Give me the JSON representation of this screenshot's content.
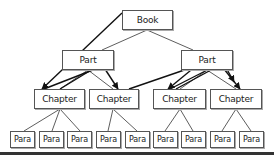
{
  "diagram": {
    "nodes": [
      {
        "id": "book",
        "label": "Book",
        "x": 122,
        "y": 10,
        "w": 51,
        "h": 20,
        "cls": ""
      },
      {
        "id": "part1",
        "label": "Part",
        "x": 62,
        "y": 50,
        "w": 52,
        "h": 20,
        "cls": ""
      },
      {
        "id": "part2",
        "label": "Part",
        "x": 181,
        "y": 50,
        "w": 52,
        "h": 20,
        "cls": ""
      },
      {
        "id": "ch1",
        "label": "Chapter",
        "x": 34,
        "y": 89,
        "w": 51,
        "h": 20,
        "cls": ""
      },
      {
        "id": "ch2",
        "label": "Chapter",
        "x": 89,
        "y": 89,
        "w": 50,
        "h": 20,
        "cls": ""
      },
      {
        "id": "ch3",
        "label": "Chapter",
        "x": 153,
        "y": 89,
        "w": 53,
        "h": 20,
        "cls": ""
      },
      {
        "id": "ch4",
        "label": "Chapter",
        "x": 210,
        "y": 89,
        "w": 52,
        "h": 20,
        "cls": ""
      },
      {
        "id": "p1",
        "label": "Para",
        "x": 10,
        "y": 131,
        "w": 25,
        "h": 17,
        "cls": "para"
      },
      {
        "id": "p2",
        "label": "Para",
        "x": 39,
        "y": 131,
        "w": 25,
        "h": 17,
        "cls": "para"
      },
      {
        "id": "p3",
        "label": "Para",
        "x": 67,
        "y": 131,
        "w": 25,
        "h": 17,
        "cls": "para"
      },
      {
        "id": "p4",
        "label": "Para",
        "x": 96,
        "y": 131,
        "w": 25,
        "h": 17,
        "cls": "para"
      },
      {
        "id": "p5",
        "label": "Para",
        "x": 125,
        "y": 131,
        "w": 25,
        "h": 17,
        "cls": "para"
      },
      {
        "id": "p6",
        "label": "Para",
        "x": 153,
        "y": 131,
        "w": 25,
        "h": 17,
        "cls": "para"
      },
      {
        "id": "p7",
        "label": "Para",
        "x": 181,
        "y": 131,
        "w": 25,
        "h": 17,
        "cls": "para"
      },
      {
        "id": "p8",
        "label": "Para",
        "x": 210,
        "y": 131,
        "w": 25,
        "h": 17,
        "cls": "para"
      },
      {
        "id": "p9",
        "label": "Para",
        "x": 239,
        "y": 131,
        "w": 25,
        "h": 17,
        "cls": "para"
      }
    ],
    "tree_edges": [
      [
        147,
        30,
        102,
        50
      ],
      [
        147,
        30,
        193,
        50
      ],
      [
        88,
        70,
        60,
        89
      ],
      [
        88,
        70,
        113,
        89
      ],
      [
        207,
        70,
        180,
        89
      ],
      [
        207,
        70,
        236,
        89
      ],
      [
        60,
        109,
        24,
        131
      ],
      [
        60,
        109,
        52,
        131
      ],
      [
        60,
        109,
        80,
        131
      ],
      [
        113,
        109,
        108,
        131
      ],
      [
        113,
        109,
        137,
        131
      ],
      [
        180,
        109,
        165,
        131
      ],
      [
        180,
        109,
        193,
        131
      ],
      [
        236,
        109,
        222,
        131
      ],
      [
        236,
        109,
        251,
        131
      ]
    ],
    "arrow_edges": [
      [
        122,
        13,
        42,
        89
      ],
      [
        44,
        89,
        103,
        66
      ],
      [
        103,
        66,
        118,
        89
      ],
      [
        60,
        89,
        101,
        64
      ],
      [
        129,
        89,
        196,
        66
      ],
      [
        196,
        66,
        168,
        89
      ],
      [
        170,
        89,
        219,
        64
      ],
      [
        176,
        89,
        222,
        64
      ],
      [
        220,
        64,
        240,
        89
      ],
      [
        224,
        64,
        234,
        82
      ]
    ],
    "colors": {
      "line": "#333333",
      "box_border": "#555555",
      "arrow": "#111111"
    }
  }
}
